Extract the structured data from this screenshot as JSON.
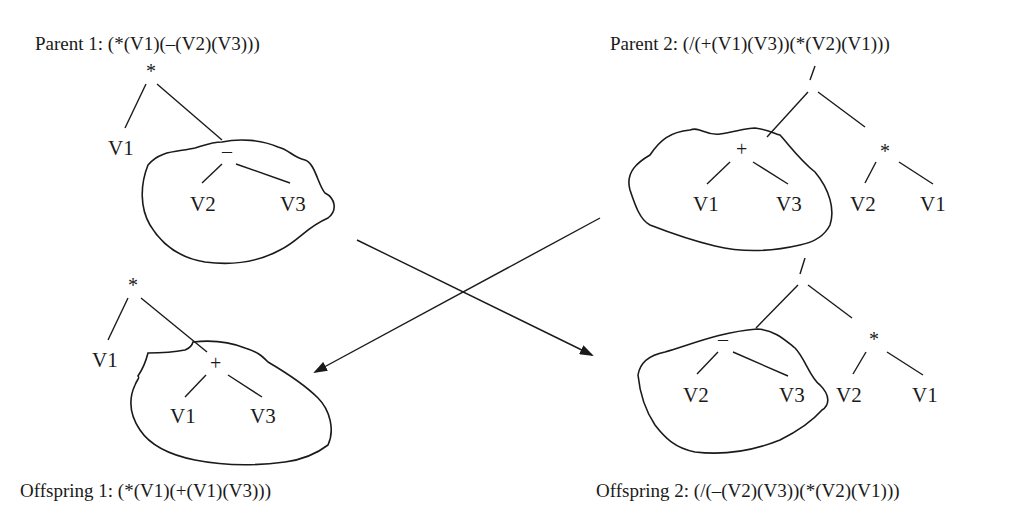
{
  "diagram": {
    "type": "genetic-programming-crossover",
    "parent1": {
      "caption": "Parent 1: (*(V1)(–(V2)(V3)))",
      "root": "*",
      "left_leaf": "V1",
      "subtree_op": "–",
      "subtree_left": "V2",
      "subtree_right": "V3"
    },
    "parent2": {
      "caption": "Parent 2: (/(+(V1)(V3))(*(V2)(V1)))",
      "root": "/",
      "subtree_op": "+",
      "subtree_left": "V1",
      "subtree_right": "V3",
      "right_op": "*",
      "right_left": "V2",
      "right_right": "V1"
    },
    "offspring1": {
      "caption": "Offspring 1: (*(V1)(+(V1)(V3)))",
      "root": "*",
      "left_leaf": "V1",
      "subtree_op": "+",
      "subtree_left": "V1",
      "subtree_right": "V3"
    },
    "offspring2": {
      "caption": "Offspring 2: (/(–(V2)(V3))(*(V2)(V1)))",
      "root": "/",
      "subtree_op": "–",
      "subtree_left": "V2",
      "subtree_right": "V3",
      "right_op": "*",
      "right_left": "V2",
      "right_right": "V1"
    }
  }
}
